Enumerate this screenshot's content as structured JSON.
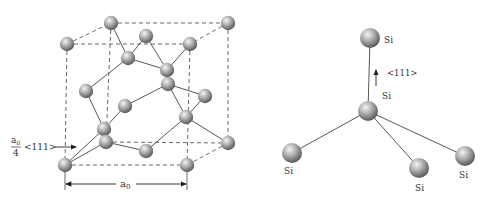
{
  "left_figure": {
    "name": "diamond-lattice-unit-cell",
    "atoms": [
      {
        "id": "a1",
        "x": 67,
        "y": 44
      },
      {
        "id": "a2",
        "x": 111,
        "y": 23
      },
      {
        "id": "a3",
        "x": 228,
        "y": 23
      },
      {
        "id": "a4",
        "x": 190,
        "y": 44
      },
      {
        "id": "a5",
        "x": 146,
        "y": 36
      },
      {
        "id": "a6",
        "x": 128,
        "y": 58
      },
      {
        "id": "a7",
        "x": 167,
        "y": 70
      },
      {
        "id": "a8",
        "x": 168,
        "y": 84
      },
      {
        "id": "a9",
        "x": 86,
        "y": 91
      },
      {
        "id": "a10",
        "x": 205,
        "y": 96
      },
      {
        "id": "a11",
        "x": 125,
        "y": 106
      },
      {
        "id": "a12",
        "x": 104,
        "y": 129
      },
      {
        "id": "a13",
        "x": 186,
        "y": 117
      },
      {
        "id": "a14",
        "x": 106,
        "y": 142
      },
      {
        "id": "a15",
        "x": 146,
        "y": 151
      },
      {
        "id": "a16",
        "x": 228,
        "y": 143
      },
      {
        "id": "a17",
        "x": 65,
        "y": 165
      },
      {
        "id": "a18",
        "x": 187,
        "y": 165
      }
    ],
    "bonds": [
      [
        "a2",
        "a6"
      ],
      [
        "a6",
        "a5"
      ],
      [
        "a6",
        "a7"
      ],
      [
        "a5",
        "a7"
      ],
      [
        "a7",
        "a4"
      ],
      [
        "a7",
        "a8"
      ],
      [
        "a8",
        "a11"
      ],
      [
        "a8",
        "a10"
      ],
      [
        "a8",
        "a13"
      ],
      [
        "a10",
        "a13"
      ],
      [
        "a13",
        "a16"
      ],
      [
        "a13",
        "a15"
      ],
      [
        "a15",
        "a14"
      ],
      [
        "a9",
        "a6"
      ],
      [
        "a9",
        "a12"
      ],
      [
        "a11",
        "a12"
      ],
      [
        "a12",
        "a14"
      ],
      [
        "a12",
        "a17"
      ]
    ],
    "edges_dashed": [
      [
        "a1",
        "a2"
      ],
      [
        "a2",
        "a3"
      ],
      [
        "a1",
        "a4"
      ],
      [
        "a3",
        "a4"
      ],
      [
        "a1",
        "a17"
      ],
      [
        "a4",
        "a18"
      ],
      [
        "a17",
        "a18"
      ],
      [
        "a3",
        "a16"
      ],
      [
        "a16",
        "a18"
      ],
      [
        "a2",
        "a14"
      ],
      [
        "a14",
        "a16"
      ]
    ],
    "offset_label": {
      "numerator": "a",
      "numerator_sub": "0",
      "denominator": "4",
      "direction": "<111>"
    },
    "lattice_constant_label": {
      "text": "a",
      "sub": "0"
    }
  },
  "right_figure": {
    "name": "tetrahedral-bond-structure",
    "atoms": [
      {
        "id": "top",
        "label": "Si",
        "x": 370,
        "y": 38
      },
      {
        "id": "center",
        "label": "Si",
        "x": 368,
        "y": 111
      },
      {
        "id": "left",
        "label": "Si",
        "x": 292,
        "y": 153
      },
      {
        "id": "middle",
        "label": "Si",
        "x": 419,
        "y": 168
      },
      {
        "id": "right",
        "label": "Si",
        "x": 465,
        "y": 156
      }
    ],
    "direction_label": "<111>"
  },
  "colors": {
    "atom_light": "#eeeeee",
    "atom_mid": "#a8a8a8",
    "atom_dark": "#5a5a5a",
    "line": "#444444",
    "text": "#333333"
  }
}
